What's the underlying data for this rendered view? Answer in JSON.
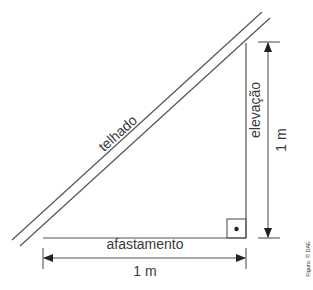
{
  "diagram": {
    "labels": {
      "roof": "telhado",
      "rise": "elevação",
      "rise_value": "1 m",
      "run": "afastamento",
      "run_value": "1 m",
      "credit": "Figura: © DAE"
    },
    "colors": {
      "line": "#555555",
      "text": "#3a3a3a",
      "background": "#ffffff"
    }
  }
}
